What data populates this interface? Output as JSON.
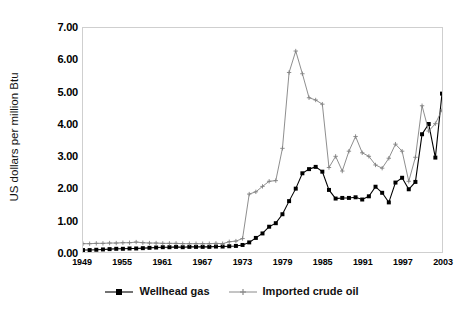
{
  "chart_data": {
    "type": "line",
    "title": "",
    "xlabel": "",
    "ylabel": "US dollars per million Btu",
    "xlim": [
      1949,
      2003
    ],
    "ylim": [
      0.0,
      7.0
    ],
    "ytick_labels": [
      "0.00",
      "1.00",
      "2.00",
      "3.00",
      "4.00",
      "5.00",
      "6.00",
      "7.00"
    ],
    "ytick_values": [
      0,
      1,
      2,
      3,
      4,
      5,
      6,
      7
    ],
    "xtick_labels": [
      "1949",
      "1955",
      "1961",
      "1967",
      "1973",
      "1979",
      "1985",
      "1991",
      "1997",
      "2003"
    ],
    "xtick_values": [
      1949,
      1955,
      1961,
      1967,
      1973,
      1979,
      1985,
      1991,
      1997,
      2003
    ],
    "grid": false,
    "legend_position": "bottom",
    "x": [
      1949,
      1950,
      1951,
      1952,
      1953,
      1954,
      1955,
      1956,
      1957,
      1958,
      1959,
      1960,
      1961,
      1962,
      1963,
      1964,
      1965,
      1966,
      1967,
      1968,
      1969,
      1970,
      1971,
      1972,
      1973,
      1974,
      1975,
      1976,
      1977,
      1978,
      1979,
      1980,
      1981,
      1982,
      1983,
      1984,
      1985,
      1986,
      1987,
      1988,
      1989,
      1990,
      1991,
      1992,
      1993,
      1994,
      1995,
      1996,
      1997,
      1998,
      1999,
      2000,
      2001,
      2002,
      2003
    ],
    "series": [
      {
        "name": "Wellhead gas",
        "color": "#000000",
        "marker": "square",
        "values": [
          0.06,
          0.06,
          0.07,
          0.08,
          0.09,
          0.1,
          0.1,
          0.11,
          0.11,
          0.12,
          0.13,
          0.14,
          0.15,
          0.15,
          0.16,
          0.15,
          0.16,
          0.16,
          0.16,
          0.16,
          0.17,
          0.17,
          0.18,
          0.19,
          0.22,
          0.3,
          0.44,
          0.58,
          0.79,
          0.9,
          1.18,
          1.59,
          1.98,
          2.46,
          2.59,
          2.66,
          2.51,
          1.94,
          1.67,
          1.69,
          1.69,
          1.71,
          1.64,
          1.74,
          2.04,
          1.85,
          1.55,
          2.17,
          2.32,
          1.96,
          2.19,
          3.68,
          4.0,
          2.95,
          4.95
        ]
      },
      {
        "name": "Imported crude oil",
        "color": "#808080",
        "marker": "plus",
        "values": [
          0.26,
          0.26,
          0.27,
          0.27,
          0.28,
          0.28,
          0.29,
          0.29,
          0.31,
          0.29,
          0.28,
          0.28,
          0.27,
          0.27,
          0.27,
          0.26,
          0.26,
          0.26,
          0.26,
          0.26,
          0.27,
          0.26,
          0.32,
          0.34,
          0.42,
          1.81,
          1.88,
          2.05,
          2.21,
          2.23,
          3.24,
          5.61,
          6.28,
          5.57,
          4.82,
          4.75,
          4.62,
          2.64,
          2.99,
          2.53,
          3.15,
          3.61,
          3.1,
          2.99,
          2.72,
          2.62,
          2.93,
          3.37,
          3.15,
          2.21,
          2.96,
          4.57,
          3.78,
          4.01,
          4.44
        ]
      }
    ]
  },
  "legend": {
    "items": [
      {
        "label": "Wellhead gas"
      },
      {
        "label": "Imported crude oil"
      }
    ]
  }
}
